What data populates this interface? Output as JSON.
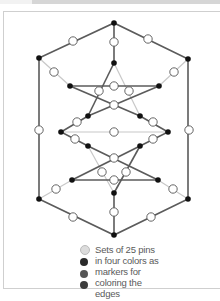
{
  "window": {
    "title_bar_visible": true
  },
  "diagram": {
    "colors": {
      "edge_dark": "#5b5b5b",
      "edge_light": "#c8c8c8",
      "vertex": "#111111",
      "pin_fill": "#ffffff",
      "pin_stroke": "#555555"
    }
  },
  "legend": {
    "dots": [
      {
        "color": "#dcdcdc"
      },
      {
        "color": "#2a2a2a"
      },
      {
        "color": "#555555"
      },
      {
        "color": "#3c3c3c"
      }
    ],
    "lines": [
      "Sets of 25 pins",
      "in four colors as",
      "markers for",
      "coloring the",
      "edges"
    ]
  }
}
